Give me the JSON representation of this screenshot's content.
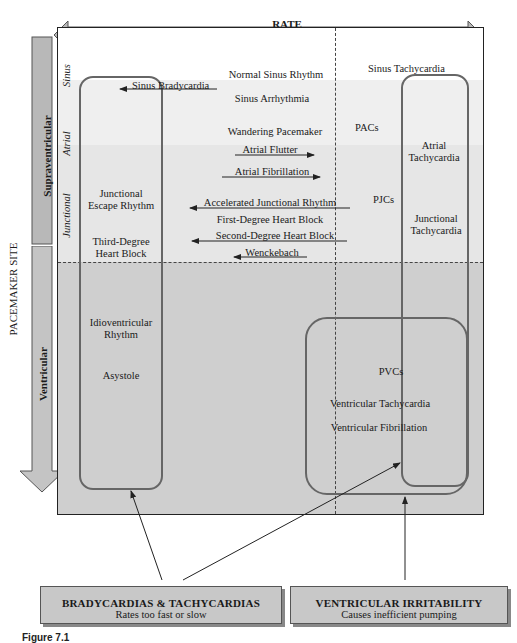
{
  "rate_axis": {
    "title": "RATE",
    "left_label": "Bradycardia",
    "center_label": "Normal",
    "right_label": "Tachycardia"
  },
  "pacemaker_axis": {
    "title": "PACEMAKER SITE",
    "upper_group": "Supraventricular",
    "lower_group": "Ventricular",
    "sites": [
      "Sinus",
      "Atrial",
      "Junctional"
    ]
  },
  "rhythms": {
    "sinus": {
      "normal": "Normal Sinus Rhythm",
      "brady": "Sinus Bradycardia",
      "arrhythmia": "Sinus Arrhythmia",
      "tachy": "Sinus Tachycardia"
    },
    "atrial": {
      "wandering": "Wandering Pacemaker",
      "flutter": "Atrial Flutter",
      "fibrillation": "Atrial Fibrillation",
      "pacs": "PACs",
      "tachy": "Atrial Tachycardia"
    },
    "junctional": {
      "escape": "Junctional Escape Rhythm",
      "third_degree": "Third-Degree Heart Block",
      "accelerated": "Accelerated Junctional Rhythm",
      "first_degree": "First-Degree Heart Block",
      "second_degree": "Second-Degree Heart Block",
      "wenckebach": "Wenckebach",
      "pjcs": "PJCs",
      "tachy": "Junctional Tachycardia"
    },
    "ventricular": {
      "idioventricular": "Idioventricular Rhythm",
      "asystole": "Asystole",
      "pvcs": "PVCs",
      "vtach": "Ventricular Tachycardia",
      "vfib": "Ventricular Fibrillation"
    }
  },
  "callouts": [
    {
      "title": "BRADYCARDIAS & TACHYCARDIAS",
      "subtitle": "Rates too fast or slow"
    },
    {
      "title": "VENTRICULAR IRRITABILITY",
      "subtitle": "Causes inefficient pumping"
    }
  ],
  "caption": "Figure 7.1"
}
